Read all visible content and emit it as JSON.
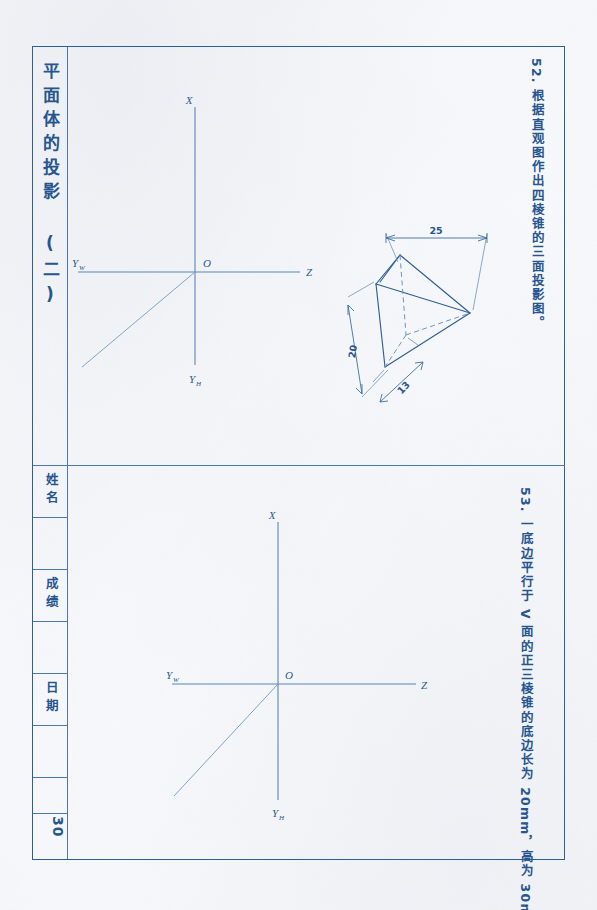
{
  "page": {
    "title": "平面体的投影 (二)",
    "page_number": "30"
  },
  "title_block": {
    "name_label": "姓名",
    "grade_label": "成绩",
    "date_label": "日期"
  },
  "problems": [
    {
      "id": "52",
      "text": "52. 根据直观图作出四棱锥的三面投影图。"
    },
    {
      "id": "53",
      "text": "53. 一底边平行于 V 面的正三棱锥的底边长为 20mm，高为 30mm，底面平行于 H 面，作出其三面投影图。"
    }
  ],
  "pictorial": {
    "dimensions": [
      {
        "name": "width",
        "value": "25"
      },
      {
        "name": "depth",
        "value": "20"
      },
      {
        "name": "base",
        "value": "13"
      }
    ]
  },
  "axes": {
    "origin_label": "O",
    "x_label": "X",
    "z_label": "Z",
    "y_h_label": "Y",
    "y_h_sub": "H",
    "y_w_label": "Y",
    "y_w_sub": "W"
  },
  "colors": {
    "ink": "#27558e",
    "line": "#4a79ad",
    "light_line": "#7ea4ca"
  }
}
